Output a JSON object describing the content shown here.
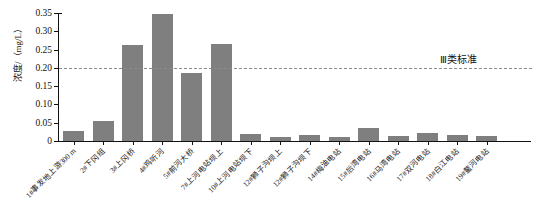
{
  "chart_data": {
    "type": "bar",
    "title": "",
    "subtitle": "",
    "xlabel": "",
    "ylabel": "浓度/（mg/L）",
    "ylim": [
      0,
      0.35
    ],
    "yticks": [
      "0",
      "0.05",
      "0.10",
      "0.15",
      "0.20",
      "0.25",
      "0.30",
      "0.35"
    ],
    "ytick_values": [
      0,
      0.05,
      0.1,
      0.15,
      0.2,
      0.25,
      0.3,
      0.35
    ],
    "grid": false,
    "legend": "none",
    "bar_color": "#7f7f7f",
    "categories": [
      "1#事发地上游300 m",
      "2#下冈组",
      "3#上冈桥",
      "4#鸡听河",
      "5#前河大桥",
      "7#上河电站坝上",
      "10#上河电站坝下",
      "12#狮子沟坝上",
      "12#狮子沟坝下",
      "14#梅油电站",
      "15#后湾电站",
      "16#马湾电站",
      "17#双河电站",
      "18#白江电站",
      "19#鳌河电站"
    ],
    "values": [
      0.027,
      0.056,
      0.262,
      0.348,
      0.185,
      0.266,
      0.02,
      0.012,
      0.017,
      0.012,
      0.035,
      0.014,
      0.022,
      0.016,
      0.014
    ],
    "annotations": [
      {
        "name": "class-iii-standard",
        "label": "Ⅲ类标准",
        "type": "hline",
        "value": 0.2,
        "style": "dashed",
        "color": "#8a8a8a"
      }
    ]
  },
  "axis": {
    "y_title": "浓度/（mg/L）"
  },
  "annotation": {
    "standard_label": "Ⅲ类标准"
  }
}
